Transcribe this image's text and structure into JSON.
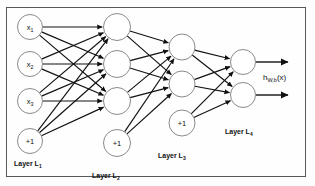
{
  "diagram": {
    "frame": {
      "border_color": "#55585c",
      "background": "#fefefe"
    },
    "node_stroke": "#8a8a8a",
    "node_fill": "#ffffff",
    "edge_color": "#111111",
    "layers": [
      {
        "id": "layer-1",
        "label": "Layer L",
        "label_sub": "1",
        "label_x": 14,
        "label_y": 160,
        "cx": 30,
        "r": 12.5,
        "nodes": [
          {
            "name": "input-x1",
            "text": "x",
            "sub": "1",
            "cy": 27
          },
          {
            "name": "input-x2",
            "text": "x",
            "sub": "2",
            "cy": 64
          },
          {
            "name": "input-x3",
            "text": "x",
            "sub": "3",
            "cy": 101
          },
          {
            "name": "bias-1",
            "text": "+1",
            "sub": "",
            "cy": 141
          }
        ]
      },
      {
        "id": "layer-2",
        "label": "Layer L",
        "label_sub": "2",
        "label_x": 92,
        "label_y": 172,
        "cx": 117,
        "r": 13.5,
        "nodes": [
          {
            "name": "hidden2-a",
            "text": "",
            "sub": "",
            "cy": 27
          },
          {
            "name": "hidden2-b",
            "text": "",
            "sub": "",
            "cy": 64
          },
          {
            "name": "hidden2-c",
            "text": "",
            "sub": "",
            "cy": 101
          },
          {
            "name": "bias-2",
            "text": "+1",
            "sub": "",
            "cy": 143
          }
        ]
      },
      {
        "id": "layer-3",
        "label": "Layer L",
        "label_sub": "3",
        "label_x": 158,
        "label_y": 152,
        "cx": 182,
        "r": 13,
        "nodes": [
          {
            "name": "hidden3-a",
            "text": "",
            "sub": "",
            "cy": 47
          },
          {
            "name": "hidden3-b",
            "text": "",
            "sub": "",
            "cy": 84
          },
          {
            "name": "bias-3",
            "text": "+1",
            "sub": "",
            "cy": 123
          }
        ]
      },
      {
        "id": "layer-4",
        "label": "Layer L",
        "label_sub": "4",
        "label_x": 225,
        "label_y": 128,
        "cx": 243,
        "r": 12.5,
        "nodes": [
          {
            "name": "output-a",
            "text": "",
            "sub": "",
            "cy": 62
          },
          {
            "name": "output-b",
            "text": "",
            "sub": "",
            "cy": 95
          }
        ]
      }
    ],
    "output_label": {
      "text": "h",
      "sub": "W,b",
      "suffix": "(x)",
      "x": 263,
      "y": 73
    },
    "output_arrows": [
      {
        "name": "output-arrow-a",
        "x1": 256,
        "y1": 62,
        "x2": 288,
        "y2": 62
      },
      {
        "name": "output-arrow-b",
        "x1": 256,
        "y1": 95,
        "x2": 288,
        "y2": 95
      }
    ]
  }
}
